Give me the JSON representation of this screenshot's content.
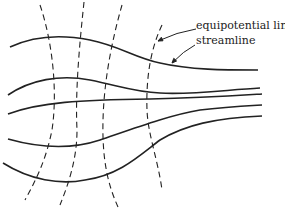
{
  "diagram": {
    "type": "flow net",
    "labels": {
      "equipotential": "equipotential line",
      "streamline": "streamline"
    },
    "colors": {
      "ink": "#222222",
      "background": "#ffffff"
    },
    "streamlines": [
      "M10,47 C40,33 70,36 90,40 C120,46 135,58 160,63 C190,70 225,70 258,70",
      "M8,95 C30,80 60,74 90,80 C120,86 135,92 160,93 C190,95 225,90 260,88",
      "M8,114 C40,102 80,100 150,99 C200,98 230,96 262,94",
      "M8,139 C40,148 70,150 100,140 C135,128 170,115 200,110 C225,107 245,106 262,105",
      "M3,163 C30,180 60,185 85,180 C120,175 140,155 160,140 C185,125 215,118 262,116"
    ],
    "equipotentials": [
      "M40,5 C52,40 58,90 52,130 C46,160 36,180 25,200",
      "M84,2 C80,40 75,90 77,130 C77,160 68,185 60,205",
      "M122,5 C112,40 104,80 103,120 C102,160 108,185 118,207",
      "M162,25 C150,50 146,80 147,110 C148,135 158,160 162,190"
    ],
    "arrows": [
      {
        "from": [
          196,
          29
        ],
        "to": [
          158,
          41
        ]
      },
      {
        "from": [
          195,
          45
        ],
        "to": [
          172,
          63
        ]
      }
    ]
  }
}
